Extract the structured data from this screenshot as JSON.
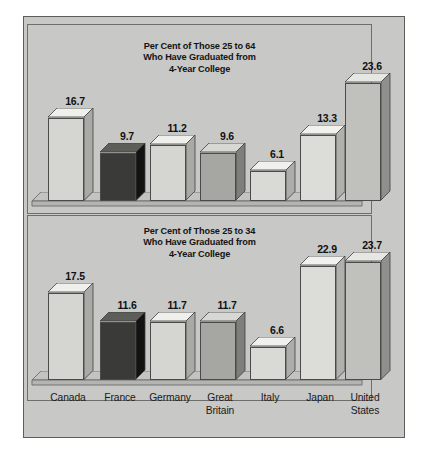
{
  "figure": {
    "background_color": "#c8c8c6",
    "border_color": "#5d5d5b"
  },
  "categories": [
    {
      "name": "Canada",
      "lines": [
        "Canada"
      ]
    },
    {
      "name": "France",
      "lines": [
        "France"
      ]
    },
    {
      "name": "Germany",
      "lines": [
        "Germany"
      ]
    },
    {
      "name": "Great Britain",
      "lines": [
        "Great",
        "Britain"
      ]
    },
    {
      "name": "Italy",
      "lines": [
        "Italy"
      ]
    },
    {
      "name": "Japan",
      "lines": [
        "Japan"
      ]
    },
    {
      "name": "United States",
      "lines": [
        "United",
        "States"
      ]
    }
  ],
  "charts": [
    {
      "id": "chart-25-to-64",
      "title_lines": [
        "Per Cent of Those 25 to 64",
        "Who Have Graduated from",
        "4-Year College"
      ],
      "values": [
        16.7,
        9.7,
        11.2,
        9.6,
        6.1,
        13.3,
        23.6
      ],
      "labels": [
        "16.7",
        "9.7",
        "11.2",
        "9.6",
        "6.1",
        "13.3",
        "23.6"
      ]
    },
    {
      "id": "chart-25-to-34",
      "title_lines": [
        "Per Cent of Those 25 to 34",
        "Who Have Graduated from",
        "4-Year College"
      ],
      "values": [
        17.5,
        11.6,
        11.7,
        11.7,
        6.6,
        22.9,
        23.7
      ],
      "labels": [
        "17.5",
        "11.6",
        "11.7",
        "11.7",
        "6.6",
        "22.9",
        "23.7"
      ]
    }
  ],
  "bar_colors": [
    {
      "front": "#d5d5d2",
      "side": "#a9a9a6",
      "top": "#efefec"
    },
    {
      "front": "#3a3a38",
      "side": "#131313",
      "top": "#5d5d5a"
    },
    {
      "front": "#d5d5d2",
      "side": "#a9a9a6",
      "top": "#efefec"
    },
    {
      "front": "#a6a6a3",
      "side": "#7e7e7b",
      "top": "#d7d7d4"
    },
    {
      "front": "#d9d9d6",
      "side": "#adadaa",
      "top": "#f0f0ed"
    },
    {
      "front": "#dcdcd9",
      "side": "#b0b0ad",
      "top": "#f1f1ee"
    },
    {
      "front": "#c0c0bd",
      "side": "#8f8f8c",
      "top": "#e6e6e3"
    }
  ],
  "chart_data": {
    "type": "bar",
    "xlabel": "",
    "ylabel": "Per Cent",
    "grid": false,
    "legend_position": "none",
    "categories": [
      "Canada",
      "France",
      "Germany",
      "Great Britain",
      "Italy",
      "Japan",
      "United States"
    ],
    "panels": [
      {
        "title": "Per Cent of Those 25 to 64 Who Have Graduated from 4-Year College",
        "age_group": "25 to 64",
        "values": [
          16.7,
          9.7,
          11.2,
          9.6,
          6.1,
          13.3,
          23.6
        ],
        "ylim": [
          0,
          25
        ]
      },
      {
        "title": "Per Cent of Those 25 to 34 Who Have Graduated from 4-Year College",
        "age_group": "25 to 34",
        "values": [
          17.5,
          11.6,
          11.7,
          11.7,
          6.6,
          22.9,
          23.7
        ],
        "ylim": [
          0,
          25
        ]
      }
    ]
  }
}
